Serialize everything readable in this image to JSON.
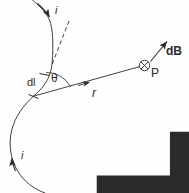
{
  "figure": {
    "stroke_color": "#2b2b2b",
    "background_color": "#fefefe",
    "labels": {
      "current_top": "i",
      "current_bottom": "i",
      "length_element": "dl",
      "angle": "θ",
      "radius_vector": "r",
      "field_point": "P",
      "field_vector": "dB"
    },
    "symbols": {
      "into_page": "⊗"
    }
  }
}
